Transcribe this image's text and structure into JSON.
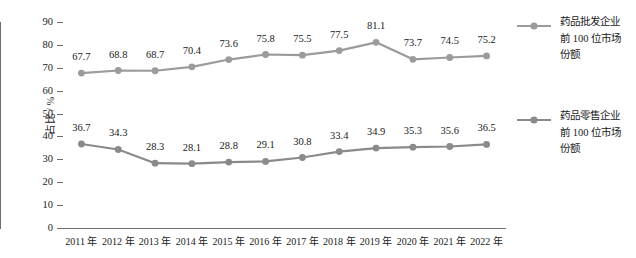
{
  "chart_data": {
    "type": "line",
    "title": "",
    "xlabel": "",
    "ylabel": "占比 / %",
    "ylim": [
      0,
      90
    ],
    "ytick_step": 10,
    "yticks": [
      "90",
      "80",
      "70",
      "60",
      "50",
      "40",
      "30",
      "20",
      "10",
      "0"
    ],
    "grid": false,
    "legend_position": "right",
    "categories": [
      "2011 年",
      "2012 年",
      "2013 年",
      "2014 年",
      "2015 年",
      "2016 年",
      "2017 年",
      "2018 年",
      "2019 年",
      "2020 年",
      "2021 年",
      "2022 年"
    ],
    "series": [
      {
        "name": "药品批发企业前 100 位市场份额",
        "color": "#9b9b9b",
        "values": [
          67.7,
          68.8,
          68.7,
          70.4,
          73.6,
          75.8,
          75.5,
          77.5,
          81.1,
          73.7,
          74.5,
          75.2
        ],
        "labels": [
          "67.7",
          "68.8",
          "68.7",
          "70.4",
          "73.6",
          "75.8",
          "75.5",
          "77.5",
          "81.1",
          "73.7",
          "74.5",
          "75.2"
        ]
      },
      {
        "name": "药品零售企业前 100 位市场份额",
        "color": "#8a8a8a",
        "values": [
          36.7,
          34.3,
          28.3,
          28.1,
          28.8,
          29.1,
          30.8,
          33.4,
          34.9,
          35.3,
          35.6,
          36.5
        ],
        "labels": [
          "36.7",
          "34.3",
          "28.3",
          "28.1",
          "28.8",
          "29.1",
          "30.8",
          "33.4",
          "34.9",
          "35.3",
          "35.6",
          "36.5"
        ]
      }
    ]
  },
  "legend": {
    "entries": [
      {
        "line1": "药品批发企业",
        "line2": "前 100 位市场",
        "line3": "份额"
      },
      {
        "line1": "药品零售企业",
        "line2": "前 100 位市场",
        "line3": "份额"
      }
    ]
  },
  "axes": {
    "y_title": "占比 / %"
  }
}
